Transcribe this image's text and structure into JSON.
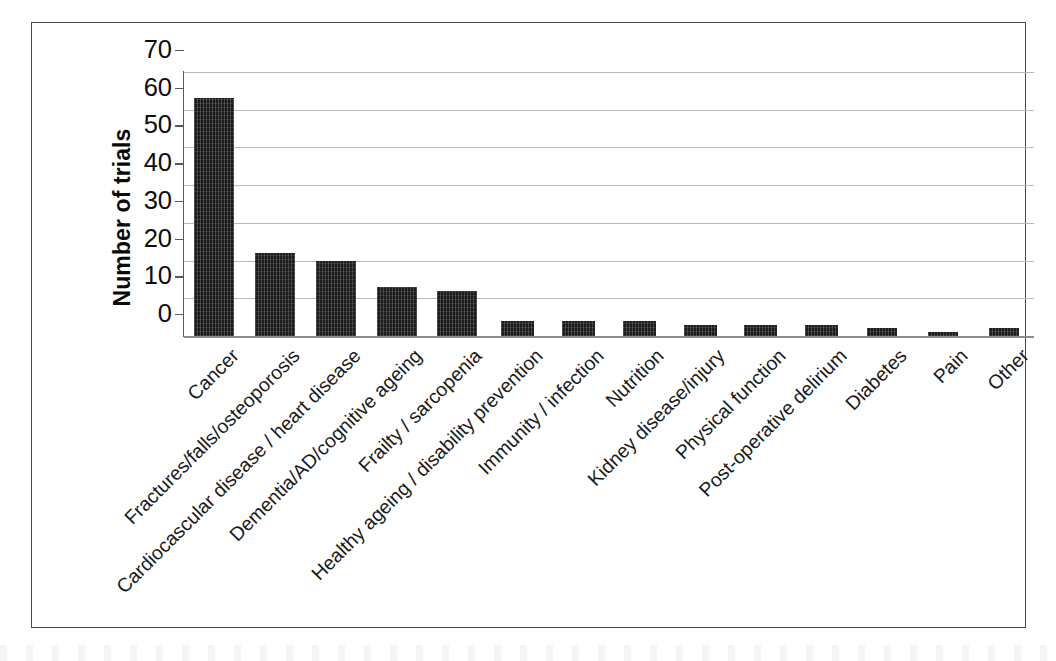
{
  "chart_data": {
    "type": "bar",
    "title": "",
    "xlabel": "",
    "ylabel": "Number of trials",
    "ylim": [
      0,
      70
    ],
    "ytick_step": 10,
    "yticks": [
      "70",
      "60",
      "50",
      "40",
      "30",
      "20",
      "10",
      "0"
    ],
    "grid": "horizontal",
    "legend": "none",
    "bar_color": "#1b1b1b",
    "bar_fill": "hatched-texture",
    "categories": [
      "Cancer",
      "Fractures/falls/osteoporosis",
      "Cardiocascular disease / heart disease",
      "Dementia/AD/cognitive ageing",
      "Frailty / sarcopenia",
      "Healthy ageing / disability prevention",
      "Immunity / infection",
      "Nutrition",
      "Kidney disease/injury",
      "Physical function",
      "Post-operative delirium",
      "Diabetes",
      "Pain",
      "Other"
    ],
    "values": [
      63,
      22,
      20,
      13,
      12,
      4,
      4,
      4,
      3,
      3,
      3,
      2,
      1,
      2
    ]
  },
  "figure": {
    "frame_color": "#4a4a4a",
    "background": "#ffffff",
    "gridline_color": "#b9b9b9",
    "axis_color": "#5a5a5a"
  }
}
